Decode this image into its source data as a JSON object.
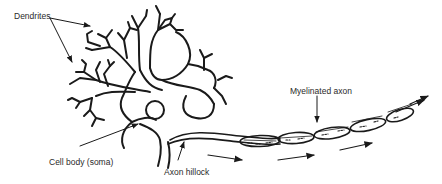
{
  "diagram": {
    "colors": {
      "stroke": "#1a1a1a",
      "label": "#2a2a2a",
      "background": "#ffffff"
    },
    "labels": {
      "dendrites": "Dendrites",
      "cell_body": "Cell body (soma)",
      "axon_hillock": "Axon hillock",
      "myelinated_axon": "Myelinated axon"
    },
    "signal_direction": "left-to-right along axon"
  }
}
